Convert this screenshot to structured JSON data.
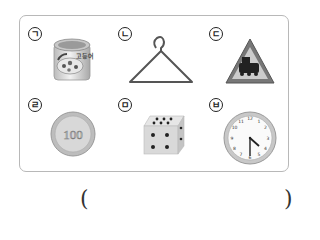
{
  "question": {
    "items": [
      {
        "label": "ㄱ",
        "name": "canned food",
        "can_text": "고등어"
      },
      {
        "label": "ㄴ",
        "name": "clothes hanger"
      },
      {
        "label": "ㄷ",
        "name": "railroad crossing warning sign"
      },
      {
        "label": "ㄹ",
        "name": "100 won coin",
        "coin_value": "100"
      },
      {
        "label": "ㅁ",
        "name": "dice"
      },
      {
        "label": "ㅂ",
        "name": "wall clock",
        "time": "4:30"
      }
    ],
    "answer_open": "(",
    "answer_close": ")",
    "answer_value": ""
  }
}
